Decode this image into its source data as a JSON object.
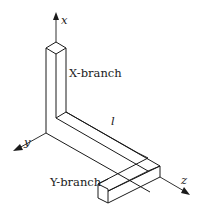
{
  "figure": {
    "type": "3D pipe/beam sketch",
    "axes": {
      "x": {
        "label": "x"
      },
      "y": {
        "label": "y"
      },
      "z": {
        "label": "z"
      }
    },
    "labels": {
      "x_branch": "X-branch",
      "length": "l",
      "y_branch": "Y-branch"
    },
    "colors": {
      "stroke": "#1a1a1a",
      "background": "#ffffff"
    }
  }
}
